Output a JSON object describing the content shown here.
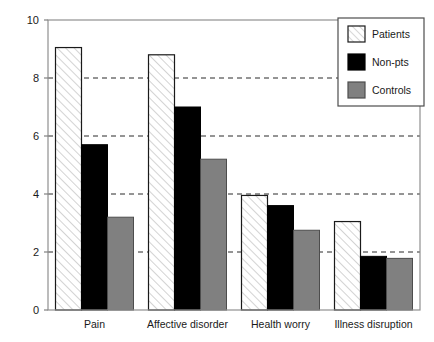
{
  "chart_data": {
    "type": "bar",
    "title": "",
    "xlabel": "",
    "ylabel": "",
    "ylim": [
      0,
      10
    ],
    "yticks": [
      0,
      2,
      4,
      6,
      8,
      10
    ],
    "ytick_labels": [
      "0",
      "2",
      "4",
      "6",
      "8",
      "10"
    ],
    "grid": true,
    "grid_style": "dashed-horizontal",
    "legend_position": "top-right",
    "categories": [
      "Pain",
      "Affective  disorder",
      "Health worry",
      "Illness disruption"
    ],
    "series": [
      {
        "name": "Patients",
        "fill": "hatch",
        "color": "#ffffff",
        "edge": "#1a1a1a",
        "values": [
          9.05,
          8.8,
          3.95,
          3.05
        ]
      },
      {
        "name": "Non-pts",
        "fill": "solid",
        "color": "#000000",
        "edge": "#000000",
        "values": [
          5.7,
          7.0,
          3.6,
          1.85
        ]
      },
      {
        "name": "Controls",
        "fill": "solid",
        "color": "#808080",
        "edge": "#4d4d4d",
        "values": [
          3.2,
          5.2,
          2.75,
          1.78
        ]
      }
    ]
  },
  "axes": {
    "frame_color": "#808080",
    "grid_color": "#2b2b2b",
    "text_color": "#1a1a1a"
  },
  "legend": {
    "items": [
      {
        "label": "Patients"
      },
      {
        "label": "Non-pts"
      },
      {
        "label": "Controls"
      }
    ],
    "border_color": "#4d4d4d",
    "background": "#ffffff"
  }
}
